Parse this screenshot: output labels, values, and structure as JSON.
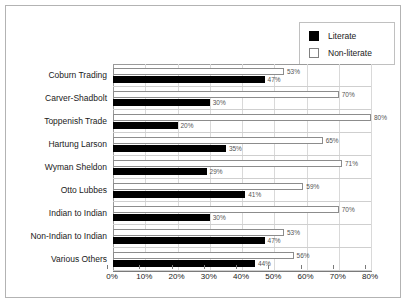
{
  "legend": {
    "entries": [
      {
        "label": "Literate",
        "swatch": "black-filled-square",
        "color": "#000000"
      },
      {
        "label": "Non-literate",
        "swatch": "white-outlined-square",
        "color": "#ffffff"
      }
    ]
  },
  "chart_data": {
    "type": "bar",
    "orientation": "horizontal",
    "title": "",
    "xlabel": "",
    "ylabel": "",
    "xlim": [
      0,
      80
    ],
    "xticks": [
      0,
      10,
      20,
      30,
      40,
      50,
      60,
      70,
      80
    ],
    "xtick_labels": [
      "0%",
      "10%",
      "20%",
      "30%",
      "40%",
      "50%",
      "60%",
      "70%",
      "80%"
    ],
    "grid": true,
    "legend_position": "top-right",
    "categories": [
      "Coburn Trading",
      "Carver-Shadbolt",
      "Toppenish Trade",
      "Hartung Larson",
      "Wyman Sheldon",
      "Otto Lubbes",
      "Indian to Indian",
      "Non-Indian to Indian",
      "Various Others"
    ],
    "series": [
      {
        "name": "Non-literate",
        "values": [
          53,
          70,
          80,
          65,
          71,
          59,
          70,
          53,
          56
        ],
        "labels": [
          "53%",
          "70%",
          "80%",
          "65%",
          "71%",
          "59%",
          "70%",
          "53%",
          "56%"
        ]
      },
      {
        "name": "Literate",
        "values": [
          47,
          30,
          20,
          35,
          29,
          41,
          30,
          47,
          44
        ],
        "labels": [
          "47%",
          "30%",
          "20%",
          "35%",
          "29%",
          "41%",
          "30%",
          "47%",
          "44%"
        ]
      }
    ]
  }
}
